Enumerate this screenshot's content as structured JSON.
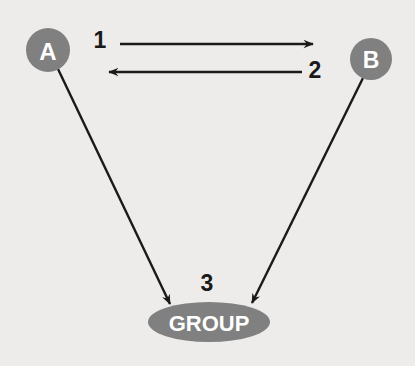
{
  "diagram": {
    "type": "communication-flow-diagram",
    "background_color": "#edecea",
    "node_fill_color": "#808080",
    "node_text_color": "#ffffff",
    "edge_color": "#1a1a1a",
    "nodes": [
      {
        "id": "a",
        "label": "A",
        "shape": "circle",
        "cx": 48,
        "cy": 50,
        "r": 22,
        "font_size": 24
      },
      {
        "id": "b",
        "label": "B",
        "shape": "circle",
        "cx": 371,
        "cy": 59,
        "r": 21,
        "font_size": 23
      },
      {
        "id": "group",
        "label": "GROUP",
        "shape": "ellipse",
        "cx": 209,
        "cy": 322,
        "rx": 61,
        "ry": 20,
        "font_size": 22
      }
    ],
    "edges": [
      {
        "id": "edge-1",
        "label": "1",
        "from": "a",
        "to": "b",
        "direction": "a-to-b",
        "x1": 120,
        "y1": 44,
        "x2": 313,
        "y2": 44,
        "label_x": 100,
        "label_y": 40,
        "label_font_size": 23
      },
      {
        "id": "edge-2",
        "label": "2",
        "from": "b",
        "to": "a",
        "direction": "b-to-a",
        "x1": 302,
        "y1": 72,
        "x2": 109,
        "y2": 72,
        "label_x": 315,
        "label_y": 70,
        "label_font_size": 23
      },
      {
        "id": "edge-3a",
        "label": "",
        "from": "a",
        "to": "group",
        "direction": "a-to-group",
        "x1": 58,
        "y1": 69,
        "x2": 170,
        "y2": 304
      },
      {
        "id": "edge-3b",
        "label": "",
        "from": "b",
        "to": "group",
        "direction": "b-to-group",
        "x1": 363,
        "y1": 78,
        "x2": 252,
        "y2": 303
      },
      {
        "id": "edge-3-label",
        "label": "3",
        "label_x": 207,
        "label_y": 283,
        "label_font_size": 23
      }
    ]
  }
}
